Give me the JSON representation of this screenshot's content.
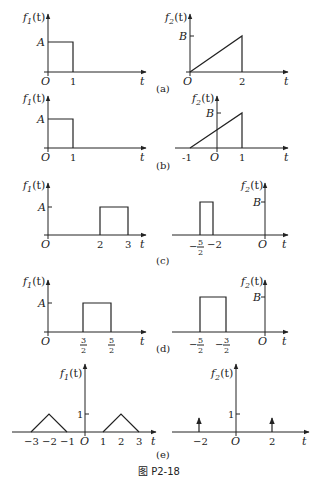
{
  "figure": {
    "caption": "图 P2-18",
    "f1_label": "f",
    "f1_sub": "1",
    "f2_label": "f",
    "f2_sub": "2",
    "t_arg": "(t)",
    "axis_t": "t",
    "origin": "O"
  },
  "panels": {
    "a": {
      "label": "(a)",
      "f1": {
        "amp_label": "A",
        "ticks": [
          "1"
        ]
      },
      "f2": {
        "amp_label": "B",
        "ticks": [
          "2"
        ]
      }
    },
    "b": {
      "label": "(b)",
      "f1": {
        "amp_label": "A",
        "ticks": [
          "1"
        ]
      },
      "f2": {
        "amp_label": "B",
        "ticks": [
          "-1",
          "1"
        ]
      }
    },
    "c": {
      "label": "(c)",
      "f1": {
        "amp_label": "A",
        "ticks": [
          "2",
          "3"
        ]
      },
      "f2": {
        "amp_label": "B",
        "ticks": [
          "-5/2",
          "-2"
        ],
        "tick_a_num": "5",
        "tick_a_den": "2",
        "tick_a_sign": "−",
        "tick_b": "−2"
      }
    },
    "d": {
      "label": "(d)",
      "f1": {
        "amp_label": "A",
        "tick_a_num": "3",
        "tick_a_den": "2",
        "tick_b_num": "5",
        "tick_b_den": "2"
      },
      "f2": {
        "amp_label": "B",
        "tick_a_sign": "−",
        "tick_a_num": "5",
        "tick_a_den": "2",
        "tick_b_sign": "−",
        "tick_b_num": "3",
        "tick_b_den": "2"
      }
    },
    "e": {
      "label": "(e)",
      "f1": {
        "amp_label": "1",
        "ticks": [
          "−3",
          "−2",
          "−1",
          "1",
          "2",
          "3"
        ]
      },
      "f2": {
        "amp_label": "1",
        "ticks": [
          "−2",
          "2"
        ]
      }
    }
  }
}
